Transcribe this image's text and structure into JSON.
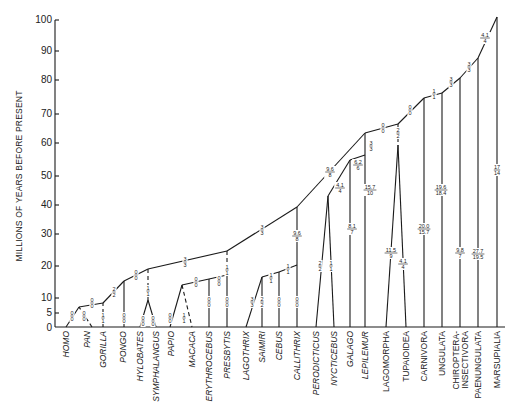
{
  "axis": {
    "title": "MILLIONS OF YEARS BEFORE PRESENT",
    "ticks": [
      {
        "label": "100",
        "value": 100
      },
      {
        "label": "90",
        "value": 90
      },
      {
        "label": "80",
        "value": 80
      },
      {
        "label": "70",
        "value": 70
      },
      {
        "label": "60",
        "value": 60
      },
      {
        "label": "50",
        "value": 50
      },
      {
        "label": "40",
        "value": 40
      },
      {
        "label": "30",
        "value": 30
      },
      {
        "label": "20",
        "value": 20
      },
      {
        "label": "10",
        "value": 10
      },
      {
        "label": "5",
        "value": 5
      },
      {
        "label": "0",
        "value": 0
      }
    ]
  },
  "taxa": [
    {
      "label": "HOMO",
      "italic": true
    },
    {
      "label": "PAN",
      "italic": true
    },
    {
      "label": "GORILLA",
      "italic": true
    },
    {
      "label": "PONGO",
      "italic": true
    },
    {
      "label": "HYLOBATES",
      "italic": true
    },
    {
      "label": "SYMPHALANGUS",
      "italic": true
    },
    {
      "label": "PAPIO",
      "italic": true
    },
    {
      "label": "MACACA",
      "italic": true
    },
    {
      "label": "ERYTHROCEBUS",
      "italic": true
    },
    {
      "label": "PRESBYTIS",
      "italic": true
    },
    {
      "label": "LAGOTHRIX",
      "italic": true
    },
    {
      "label": "SAIMIRI",
      "italic": true
    },
    {
      "label": "CEBUS",
      "italic": true
    },
    {
      "label": "CALLITHRIX",
      "italic": true
    },
    {
      "label": "PERODICTICUS",
      "italic": true
    },
    {
      "label": "NYCTICEBUS",
      "italic": true
    },
    {
      "label": "GALAGO",
      "italic": true
    },
    {
      "label": "LEPILEMUR",
      "italic": true
    },
    {
      "label": "LAGOMORPHA",
      "italic": false
    },
    {
      "label": "TUPAIOIDEA",
      "italic": false
    },
    {
      "label": "CARNIVORA",
      "italic": false
    },
    {
      "label": "UNGULATA",
      "italic": false
    },
    {
      "label": "CHIROPTERA-",
      "italic": false,
      "line2": "INSECTIVORA"
    },
    {
      "label": "PAENUNGULATA",
      "italic": false
    },
    {
      "label": "MARSUPIALIA",
      "italic": false
    }
  ],
  "branch_labels": [
    {
      "num": "0",
      "den": "0",
      "x": 72,
      "y": 316
    },
    {
      "num": "0",
      "den": "0",
      "x": 84,
      "y": 316
    },
    {
      "num": "0",
      "den": "0",
      "x": 92,
      "y": 303
    },
    {
      "num": "1",
      "den": "1",
      "x": 103,
      "y": 318
    },
    {
      "num": "2",
      "den": "2",
      "x": 114,
      "y": 292
    },
    {
      "num": "0",
      "den": "0",
      "x": 124,
      "y": 318
    },
    {
      "num": "0",
      "den": "0",
      "x": 136,
      "y": 275
    },
    {
      "num": "1",
      "den": "1",
      "x": 148,
      "y": 291
    },
    {
      "num": "0",
      "den": "0",
      "x": 143,
      "y": 321
    },
    {
      "num": "0",
      "den": "0",
      "x": 153,
      "y": 321
    },
    {
      "num": "3",
      "den": "3",
      "x": 185,
      "y": 262
    },
    {
      "num": "0",
      "den": "0",
      "x": 170,
      "y": 318
    },
    {
      "num": "1",
      "den": "1",
      "x": 184,
      "y": 318
    },
    {
      "num": "0",
      "den": "0",
      "x": 196,
      "y": 282
    },
    {
      "num": "0",
      "den": "0",
      "x": 209,
      "y": 302
    },
    {
      "num": "0",
      "den": "0",
      "x": 219,
      "y": 281
    },
    {
      "num": "1",
      "den": "1",
      "x": 227,
      "y": 270
    },
    {
      "num": "0",
      "den": "0",
      "x": 227,
      "y": 302
    },
    {
      "num": "3",
      "den": "3",
      "x": 262,
      "y": 230
    },
    {
      "num": "3",
      "den": "3",
      "x": 252,
      "y": 302
    },
    {
      "num": "2",
      "den": "2",
      "x": 262,
      "y": 302
    },
    {
      "num": "1",
      "den": "1",
      "x": 271,
      "y": 278
    },
    {
      "num": "0",
      "den": "0",
      "x": 279,
      "y": 302
    },
    {
      "num": "1",
      "den": "1",
      "x": 288,
      "y": 269
    },
    {
      "num": "9.6",
      "den": "8",
      "x": 297,
      "y": 236
    },
    {
      "num": "0",
      "den": "0",
      "x": 297,
      "y": 302
    },
    {
      "num": "2",
      "den": "2",
      "x": 320,
      "y": 266
    },
    {
      "num": "1",
      "den": "1",
      "x": 331,
      "y": 266
    },
    {
      "num": "9.6",
      "den": "8",
      "x": 330,
      "y": 172
    },
    {
      "num": "4.1",
      "den": "4",
      "x": 340,
      "y": 188
    },
    {
      "num": "8.1",
      "den": "7",
      "x": 352,
      "y": 229
    },
    {
      "num": "6.2",
      "den": "6",
      "x": 358,
      "y": 165
    },
    {
      "num": "3",
      "den": "3",
      "x": 371,
      "y": 146
    },
    {
      "num": "15.7",
      "den": "10",
      "x": 370,
      "y": 190
    },
    {
      "num": "0",
      "den": "0",
      "x": 383,
      "y": 128
    },
    {
      "num": "2",
      "den": "2",
      "x": 398,
      "y": 133
    },
    {
      "num": "11.5",
      "den": "9",
      "x": 391,
      "y": 253
    },
    {
      "num": "4.1",
      "den": "4",
      "x": 403,
      "y": 264
    },
    {
      "num": "0",
      "den": "0",
      "x": 410,
      "y": 110
    },
    {
      "num": "1",
      "den": "1",
      "x": 434,
      "y": 94
    },
    {
      "num": "20.0",
      "den": "15.7",
      "x": 424,
      "y": 229
    },
    {
      "num": "19.6",
      "den": "18.4",
      "x": 441,
      "y": 190
    },
    {
      "num": "3",
      "den": "3",
      "x": 451,
      "y": 82
    },
    {
      "num": "9.8",
      "den": "7",
      "x": 460,
      "y": 253
    },
    {
      "num": "3",
      "den": "3",
      "x": 469,
      "y": 67
    },
    {
      "num": "27.7",
      "den": "19.5",
      "x": 478,
      "y": 254
    },
    {
      "num": "4.1",
      "den": "4",
      "x": 485,
      "y": 38
    },
    {
      "num": "17",
      "den": "14",
      "x": 497,
      "y": 170
    }
  ]
}
